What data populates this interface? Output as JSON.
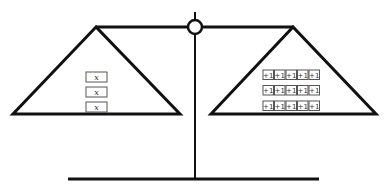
{
  "diagram": {
    "type": "balance-scale",
    "stroke_color": "#111111",
    "box_stroke_color": "#555555",
    "left_pan": {
      "items": [
        {
          "label": "x"
        },
        {
          "label": "x"
        },
        {
          "label": "x"
        }
      ]
    },
    "right_pan": {
      "rows": [
        [
          "+1",
          "+1",
          "+1",
          "+1",
          "+1"
        ],
        [
          "+1",
          "+1",
          "+1",
          "+1",
          "+1"
        ],
        [
          "+1",
          "+1",
          "+1",
          "+1",
          "+1"
        ]
      ]
    }
  }
}
